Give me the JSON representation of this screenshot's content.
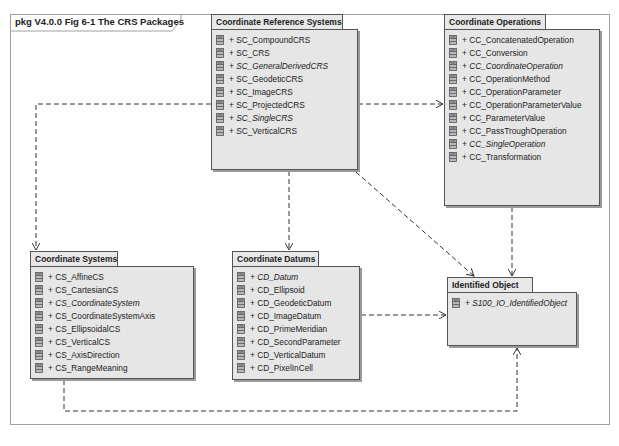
{
  "diagram": {
    "frame_label": "pkg V4.0.0 Fig 6-1 The CRS Packages",
    "colors": {
      "package_fill": "#e6e6e6",
      "package_border": "#555555",
      "frame_border": "#a0a0a0",
      "dependency_line": "#333333"
    },
    "packages": {
      "crs": {
        "title": "Coordinate Reference Systems",
        "items": [
          {
            "label": "+ SC_CompoundCRS",
            "abstract": false
          },
          {
            "label": "+ SC_CRS",
            "abstract": false
          },
          {
            "label": "+ SC_GeneralDerivedCRS",
            "abstract": true
          },
          {
            "label": "+ SC_GeodeticCRS",
            "abstract": false
          },
          {
            "label": "+ SC_ImageCRS",
            "abstract": false
          },
          {
            "label": "+ SC_ProjectedCRS",
            "abstract": false
          },
          {
            "label": "+ SC_SingleCRS",
            "abstract": true
          },
          {
            "label": "+ SC_VerticalCRS",
            "abstract": false
          }
        ]
      },
      "co": {
        "title": "Coordinate Operations",
        "items": [
          {
            "label": "+ CC_ConcatenatedOperation",
            "abstract": false
          },
          {
            "label": "+ CC_Conversion",
            "abstract": false
          },
          {
            "label": "+ CC_CoordinateOperation",
            "abstract": true
          },
          {
            "label": "+ CC_OperationMethod",
            "abstract": false
          },
          {
            "label": "+ CC_OperationParameter",
            "abstract": false
          },
          {
            "label": "+ CC_OperationParameterValue",
            "abstract": false
          },
          {
            "label": "+ CC_ParameterValue",
            "abstract": false
          },
          {
            "label": "+ CC_PassTroughOperation",
            "abstract": false
          },
          {
            "label": "+ CC_SingleOperation",
            "abstract": true
          },
          {
            "label": "+ CC_Transformation",
            "abstract": false
          }
        ]
      },
      "cs": {
        "title": "Coordinate Systems",
        "items": [
          {
            "label": "+ CS_AffineCS",
            "abstract": false
          },
          {
            "label": "+ CS_CartesianCS",
            "abstract": false
          },
          {
            "label": "+ CS_CoordinateSystem",
            "abstract": true
          },
          {
            "label": "+ CS_CoordinateSystemAxis",
            "abstract": false
          },
          {
            "label": "+ CS_EllipsoidalCS",
            "abstract": false
          },
          {
            "label": "+ CS_VerticalCS",
            "abstract": false
          },
          {
            "label": "+ CS_AxisDirection",
            "abstract": false
          },
          {
            "label": "+ CS_RangeMeaning",
            "abstract": false
          }
        ]
      },
      "cd": {
        "title": "Coordinate Datums",
        "items": [
          {
            "label": "+ CD_Datum",
            "abstract": true
          },
          {
            "label": "+ CD_Ellipsoid",
            "abstract": false
          },
          {
            "label": "+ CD_GeodeticDatum",
            "abstract": false
          },
          {
            "label": "+ CD_ImageDatum",
            "abstract": false
          },
          {
            "label": "+ CD_PrimeMeridian",
            "abstract": false
          },
          {
            "label": "+ CD_SecondParameter",
            "abstract": false
          },
          {
            "label": "+ CD_VerticalDatum",
            "abstract": false
          },
          {
            "label": "+ CD_PixelInCell",
            "abstract": false
          }
        ]
      },
      "io": {
        "title": "Identified Object",
        "items": [
          {
            "label": "+ S100_IO_IdentifiedObject",
            "abstract": true
          }
        ]
      }
    },
    "dependencies": [
      {
        "from": "Coordinate Reference Systems",
        "to": "Coordinate Systems"
      },
      {
        "from": "Coordinate Reference Systems",
        "to": "Coordinate Operations"
      },
      {
        "from": "Coordinate Reference Systems",
        "to": "Coordinate Datums"
      },
      {
        "from": "Coordinate Reference Systems",
        "to": "Identified Object"
      },
      {
        "from": "Coordinate Operations",
        "to": "Identified Object"
      },
      {
        "from": "Coordinate Datums",
        "to": "Identified Object"
      },
      {
        "from": "Coordinate Systems",
        "to": "Identified Object"
      }
    ]
  }
}
